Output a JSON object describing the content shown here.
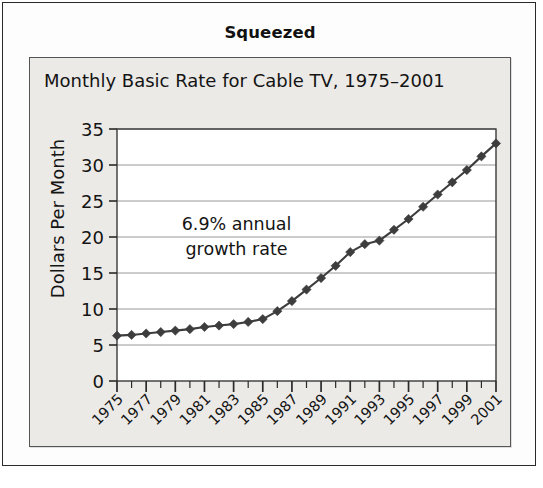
{
  "figure": {
    "label": "Squeezed"
  },
  "chart_data": {
    "type": "line",
    "title": "Monthly Basic Rate for Cable TV, 1975–2001",
    "xlabel": "",
    "ylabel": "Dollars Per Month",
    "ylim": [
      0,
      35
    ],
    "ytick_values": [
      0,
      5,
      10,
      15,
      20,
      25,
      30,
      35
    ],
    "ytick_labels": [
      "0",
      "5",
      "10",
      "15",
      "20",
      "25",
      "30",
      "35"
    ],
    "grid": "horizontal",
    "legend": "none",
    "marker": "diamond",
    "series_color": "#3d3d3d",
    "plot_background": "#ffffff",
    "panel_background": "#eceae7",
    "x": [
      1975,
      1976,
      1977,
      1978,
      1979,
      1980,
      1981,
      1982,
      1983,
      1984,
      1985,
      1986,
      1987,
      1988,
      1989,
      1990,
      1991,
      1992,
      1993,
      1994,
      1995,
      1996,
      1997,
      1998,
      1999,
      2000,
      2001
    ],
    "values": [
      6.3,
      6.4,
      6.6,
      6.8,
      7.0,
      7.2,
      7.5,
      7.7,
      7.9,
      8.2,
      8.6,
      9.7,
      11.1,
      12.7,
      14.3,
      16.0,
      17.9,
      19.0,
      19.5,
      21.0,
      22.5,
      24.2,
      25.9,
      27.6,
      29.3,
      31.2,
      33.0
    ],
    "xtick_labels": [
      "1975",
      "1977",
      "1979",
      "1981",
      "1983",
      "1985",
      "1987",
      "1989",
      "1991",
      "1993",
      "1995",
      "1997",
      "1999",
      "2001"
    ],
    "xtick_rotation": 45,
    "annotations": [
      {
        "line1": "6.9% annual",
        "line2": "growth rate",
        "x": 1983.2,
        "y": 21.0
      }
    ]
  }
}
